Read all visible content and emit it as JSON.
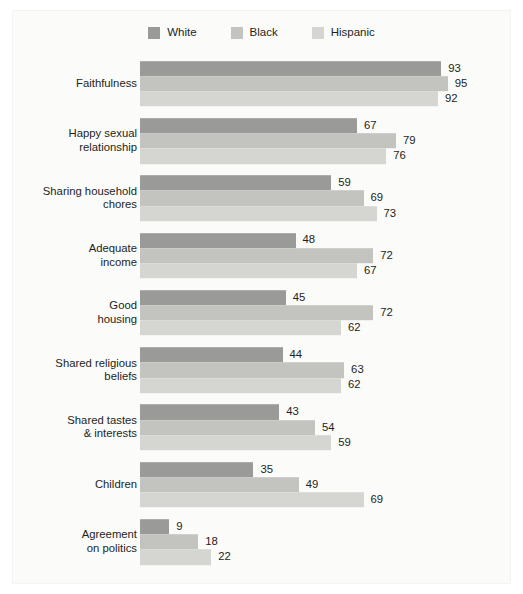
{
  "legend": {
    "items": [
      {
        "label": "White",
        "color": "#9a9a98"
      },
      {
        "label": "Black",
        "color": "#c3c3c0"
      },
      {
        "label": "Hispanic",
        "color": "#d5d5d2"
      }
    ]
  },
  "chart_data": {
    "type": "bar",
    "orientation": "horizontal",
    "title": "",
    "subtitle": "",
    "xlabel": "",
    "ylabel": "",
    "xlim": [
      0,
      100
    ],
    "grid": false,
    "legend_position": "top-center",
    "categories": [
      "Faithfulness",
      "Happy sexual relationship",
      "Sharing household chores",
      "Adequate income",
      "Good housing",
      "Shared religious beliefs",
      "Shared tastes & interests",
      "Children",
      "Agreement on politics"
    ],
    "category_lines": [
      [
        "Faithfulness"
      ],
      [
        "Happy sexual",
        "relationship"
      ],
      [
        "Sharing household",
        "chores"
      ],
      [
        "Adequate",
        "income"
      ],
      [
        "Good",
        "housing"
      ],
      [
        "Shared religious",
        "beliefs"
      ],
      [
        "Shared tastes",
        "& interests"
      ],
      [
        "Children"
      ],
      [
        "Agreement",
        "on politics"
      ]
    ],
    "series": [
      {
        "name": "White",
        "color": "#9a9a98",
        "values": [
          93,
          67,
          59,
          48,
          45,
          44,
          43,
          35,
          9
        ]
      },
      {
        "name": "Black",
        "color": "#c3c3c0",
        "values": [
          95,
          79,
          69,
          72,
          72,
          63,
          54,
          49,
          18
        ]
      },
      {
        "name": "Hispanic",
        "color": "#d5d5d2",
        "values": [
          92,
          76,
          73,
          67,
          62,
          62,
          59,
          69,
          22
        ]
      }
    ]
  }
}
